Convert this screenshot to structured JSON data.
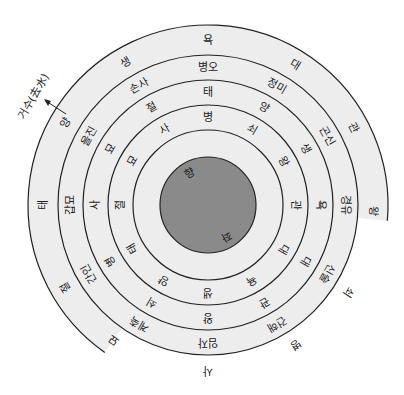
{
  "diagram": {
    "title": "",
    "center": {
      "x": 208,
      "y": 205
    },
    "colors": {
      "ring_fill": "#ededed",
      "core_fill": "#8a8a8a",
      "stroke": "#222222",
      "text": "#1a1a1a",
      "background": "#ffffff"
    },
    "annotation": {
      "label": "거수(去水)",
      "meaning": "outflowing water"
    },
    "core": {
      "radius": 48,
      "labels": [
        {
          "text": "향",
          "angle": -120
        },
        {
          "text": "좌",
          "angle": 60
        }
      ]
    },
    "rings": [
      {
        "name": "outer-stage-ring",
        "r_in": 150,
        "r_out": 180,
        "labels": [
          {
            "text": "욕",
            "angle": -90
          },
          {
            "text": "대",
            "angle": -58
          },
          {
            "text": "관",
            "angle": -28
          },
          {
            "text": "왕",
            "angle": 2
          },
          {
            "text": "쇠",
            "angle": 32
          },
          {
            "text": "병",
            "angle": 58
          },
          {
            "text": "사",
            "angle": 90
          },
          {
            "text": "묘",
            "angle": 125
          },
          {
            "text": "절",
            "angle": 150
          },
          {
            "text": "태",
            "angle": 180
          },
          {
            "text": "양",
            "angle": 210
          },
          {
            "text": "생",
            "angle": 240
          }
        ]
      },
      {
        "name": "direction-ring",
        "r_in": 125,
        "r_out": 150,
        "labels": [
          {
            "text": "병오",
            "angle": -90
          },
          {
            "text": "정미",
            "angle": -60
          },
          {
            "text": "곤신",
            "angle": -30
          },
          {
            "text": "경유",
            "angle": 0
          },
          {
            "text": "신술",
            "angle": 30
          },
          {
            "text": "건해",
            "angle": 60
          },
          {
            "text": "임자",
            "angle": 90
          },
          {
            "text": "계축",
            "angle": 120
          },
          {
            "text": "간인",
            "angle": 150
          },
          {
            "text": "갑묘",
            "angle": 180
          },
          {
            "text": "을진",
            "angle": 210
          },
          {
            "text": "손사",
            "angle": 240
          }
        ]
      },
      {
        "name": "stage-ring-2",
        "r_in": 100,
        "r_out": 125,
        "labels": [
          {
            "text": "태",
            "angle": -90
          },
          {
            "text": "양",
            "angle": -60
          },
          {
            "text": "생",
            "angle": -30
          },
          {
            "text": "욕",
            "angle": 0
          },
          {
            "text": "대",
            "angle": 30
          },
          {
            "text": "관",
            "angle": 60
          },
          {
            "text": "왕",
            "angle": 90
          },
          {
            "text": "쇠",
            "angle": 120
          },
          {
            "text": "병",
            "angle": 150
          },
          {
            "text": "사",
            "angle": 180
          },
          {
            "text": "묘",
            "angle": 210
          },
          {
            "text": "절",
            "angle": 240
          }
        ]
      },
      {
        "name": "stage-ring-3",
        "r_in": 75,
        "r_out": 100,
        "labels": [
          {
            "text": "병",
            "angle": -90
          },
          {
            "text": "쇠",
            "angle": -60
          },
          {
            "text": "왕",
            "angle": -30
          },
          {
            "text": "관",
            "angle": 0
          },
          {
            "text": "대",
            "angle": 30
          },
          {
            "text": "욕",
            "angle": 60
          },
          {
            "text": "생",
            "angle": 90
          },
          {
            "text": "양",
            "angle": 120
          },
          {
            "text": "태",
            "angle": 150
          },
          {
            "text": "절",
            "angle": 180
          },
          {
            "text": "묘",
            "angle": 210
          },
          {
            "text": "사",
            "angle": 240
          }
        ]
      }
    ]
  }
}
